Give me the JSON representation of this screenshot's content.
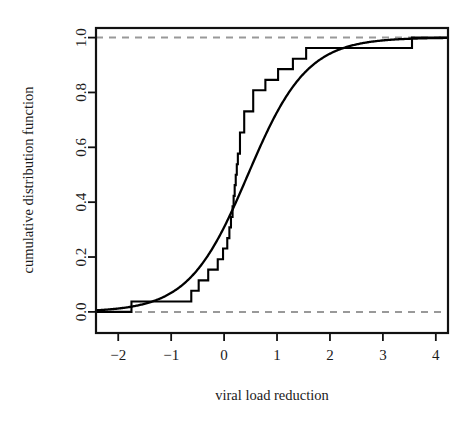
{
  "chart_data": {
    "type": "line",
    "title": "",
    "subtitle": "",
    "xlabel": "viral load reduction",
    "ylabel": "cumulative distribution function",
    "xlim": [
      -2.42,
      4.23
    ],
    "ylim": [
      -0.077,
      1.035
    ],
    "grid": false,
    "legend": "none",
    "box": true,
    "xticks": [
      -2,
      -1,
      0,
      1,
      2,
      3,
      4
    ],
    "xticklabels": [
      "−2",
      "−1",
      "0",
      "1",
      "2",
      "3",
      "4"
    ],
    "yticks": [
      0.0,
      0.2,
      0.4,
      0.6,
      0.8,
      1.0
    ],
    "yticklabels": [
      "0.0",
      "0.2",
      "0.4",
      "0.6",
      "0.8",
      "1.0"
    ],
    "reference_lines": [
      {
        "name": "lower-asymptote",
        "y": 0.0,
        "style": "dashed",
        "color": "#999999"
      },
      {
        "name": "upper-asymptote",
        "y": 1.0,
        "style": "dashed",
        "color": "#999999"
      }
    ],
    "series": [
      {
        "name": "empirical cumulative distribution function",
        "type": "step",
        "style": "solid",
        "color": "#000000",
        "n": 26,
        "x": [
          -1.75,
          -0.78,
          -0.62,
          -0.48,
          -0.3,
          -0.12,
          -0.02,
          0.06,
          0.1,
          0.13,
          0.16,
          0.18,
          0.2,
          0.22,
          0.24,
          0.26,
          0.3,
          0.38,
          0.55,
          0.78,
          1.02,
          1.3,
          1.55,
          3.55
        ],
        "y": [
          0.038,
          0.038,
          0.077,
          0.115,
          0.154,
          0.192,
          0.231,
          0.269,
          0.308,
          0.346,
          0.385,
          0.423,
          0.462,
          0.5,
          0.538,
          0.577,
          0.654,
          0.731,
          0.808,
          0.846,
          0.885,
          0.923,
          0.962,
          1.0
        ]
      },
      {
        "name": "fitted logistic cumulative distribution function",
        "type": "line",
        "style": "solid",
        "color": "#000000",
        "mean": 0.45,
        "sd": 0.95
      }
    ]
  },
  "axis": {
    "x_title": "viral load reduction",
    "y_title": "cumulative distribution function"
  }
}
